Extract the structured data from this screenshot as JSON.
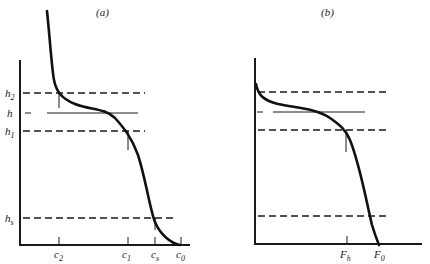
{
  "panels": [
    {
      "id": "a",
      "title": "(a)",
      "y_labels": [
        {
          "main": "h",
          "sub": "2"
        },
        {
          "main": "h",
          "sub": ""
        },
        {
          "main": "h",
          "sub": "1"
        },
        {
          "main": "h",
          "sub": "s"
        }
      ],
      "x_labels": [
        {
          "main": "c",
          "sub": "2"
        },
        {
          "main": "c",
          "sub": "1"
        },
        {
          "main": "c",
          "sub": "s"
        },
        {
          "main": "c",
          "sub": "0"
        }
      ]
    },
    {
      "id": "b",
      "title": "(b)",
      "x_labels": [
        {
          "main": "F",
          "sub": "h"
        },
        {
          "main": "F",
          "sub": "0"
        }
      ]
    }
  ],
  "colors": {
    "ink": "#1a1a1a",
    "background": "#ffffff"
  }
}
